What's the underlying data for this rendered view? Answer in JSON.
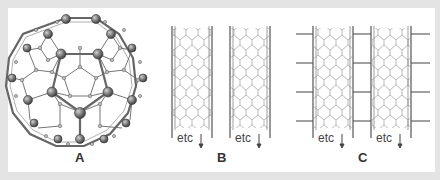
{
  "figure": {
    "panels": [
      {
        "id": "A",
        "label": "A",
        "description": "Buckminsterfullerene (C60) ball-and-stick structure"
      },
      {
        "id": "B",
        "label": "B",
        "description": "Two parallel carbon nanotubes",
        "tubes": [
          {
            "etc": "etc"
          },
          {
            "etc": "etc"
          }
        ]
      },
      {
        "id": "C",
        "label": "C",
        "description": "Two carbon nanotubes with horizontal cross-links",
        "tubes": [
          {
            "etc": "etc"
          },
          {
            "etc": "etc"
          }
        ]
      }
    ]
  },
  "colors": {
    "background": "#e4e4e4",
    "panel": "#ffffff",
    "line": "#555555",
    "atom": "#777777",
    "text": "#333333"
  }
}
